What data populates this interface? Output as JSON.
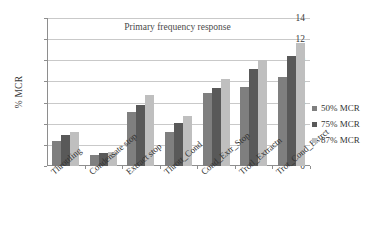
{
  "chart_data": {
    "type": "bar",
    "title": "Primary frequency response",
    "xlabel": "",
    "ylabel": "% MCR",
    "ylim": [
      0,
      14
    ],
    "ytick_step": 2,
    "yticks": [
      0,
      2,
      4,
      6,
      8,
      10,
      12,
      14
    ],
    "grid": true,
    "legend_position": "right",
    "categories": [
      "Throttling",
      "Condensate stop",
      "Extract stop",
      "Thrott_Cond",
      "Cond_Extr_Stop",
      "Trotl_Extractn",
      "Trot_Cond_Extrct"
    ],
    "series": [
      {
        "name": "50% MCR",
        "color": "#7f7f7f",
        "values": [
          2.4,
          1.0,
          5.1,
          3.2,
          6.9,
          7.5,
          8.4
        ]
      },
      {
        "name": "75% MCR",
        "color": "#595959",
        "values": [
          2.9,
          1.25,
          5.8,
          4.1,
          7.4,
          9.2,
          10.4
        ]
      },
      {
        "name": "87% MCR",
        "color": "#bfbfbf",
        "values": [
          3.2,
          1.35,
          6.7,
          4.7,
          8.2,
          10.0,
          11.6
        ]
      }
    ]
  }
}
